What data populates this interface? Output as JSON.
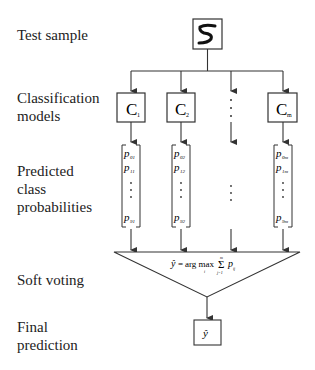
{
  "row_labels": {
    "test_sample": "Test sample",
    "classification_models_1": "Classification",
    "classification_models_2": "models",
    "predicted_1": "Predicted",
    "predicted_2": "class",
    "predicted_3": "probabilities",
    "soft_voting": "Soft voting",
    "final_1": "Final",
    "final_2": "prediction"
  },
  "test_sample": {
    "digit": "5"
  },
  "models": [
    {
      "letter": "C",
      "sub": "1"
    },
    {
      "letter": "C",
      "sub": "2"
    },
    {
      "letter": "⋮",
      "sub": ""
    },
    {
      "letter": "C",
      "sub": "m"
    }
  ],
  "probabilities": [
    {
      "p_top_sub": "01",
      "p_second_sub": "11",
      "p_bottom_sub": "91"
    },
    {
      "p_top_sub": "02",
      "p_second_sub": "12",
      "p_bottom_sub": "92"
    },
    {
      "p_top_sub": "",
      "p_second_sub": "",
      "p_bottom_sub": ""
    },
    {
      "p_top_sub": "0m",
      "p_second_sub": "1m",
      "p_bottom_sub": "9m"
    }
  ],
  "formula": {
    "lhs": "ŷ",
    "eq": "=",
    "op": "arg max",
    "op_sub": "i",
    "sum": "Σ",
    "sum_top": "m",
    "sum_bottom": "j=1",
    "term": "p",
    "term_sub": "ij"
  },
  "final": {
    "symbol": "ŷ"
  },
  "p_symbol": "p",
  "colors": {
    "line": "#333333",
    "text": "#1a1a1a"
  }
}
